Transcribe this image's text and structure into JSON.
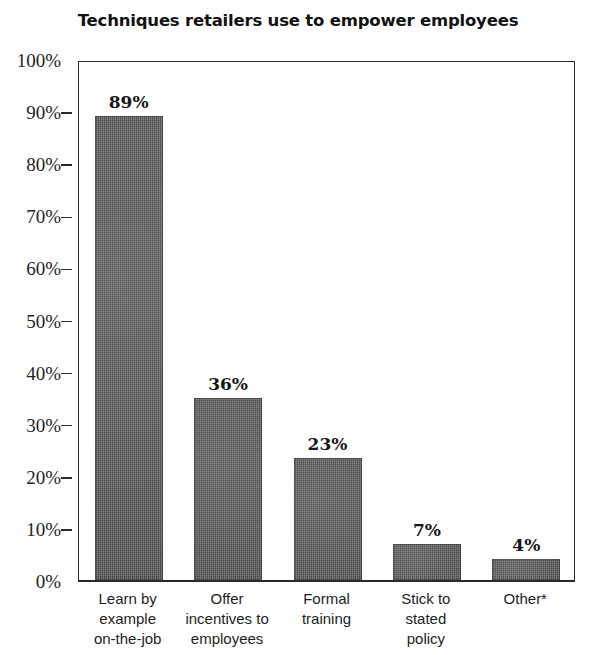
{
  "chart_data": {
    "type": "bar",
    "title": "Techniques retailers use to empower employees",
    "xlabel": "",
    "ylabel": "",
    "ylim": [
      0,
      100
    ],
    "grid": false,
    "legend": "none",
    "y_tick_labels": [
      "100%",
      "90%",
      "80%",
      "70%",
      "60%",
      "50%",
      "40%",
      "30%",
      "20%",
      "10%",
      "0%"
    ],
    "y_tick_values": [
      100,
      90,
      80,
      70,
      60,
      50,
      40,
      30,
      20,
      10,
      0
    ],
    "categories": [
      "Learn by\nexample\non-the-job",
      "Offer\nincentives to\nemployees",
      "Formal\ntraining",
      "Stick to\nstated\npolicy",
      "Other*"
    ],
    "values": [
      89,
      36,
      23,
      7,
      4
    ],
    "bar_plot_values": [
      89,
      35,
      23.5,
      7,
      4
    ],
    "data_labels": [
      "89%",
      "36%",
      "23%",
      "7%",
      "4%"
    ],
    "bar_color": "#4b4b4b",
    "axis_color": "#2a2a2a",
    "background_color": "#ffffff",
    "text_color": "#1b1b1b"
  },
  "footnote_marker": "*"
}
